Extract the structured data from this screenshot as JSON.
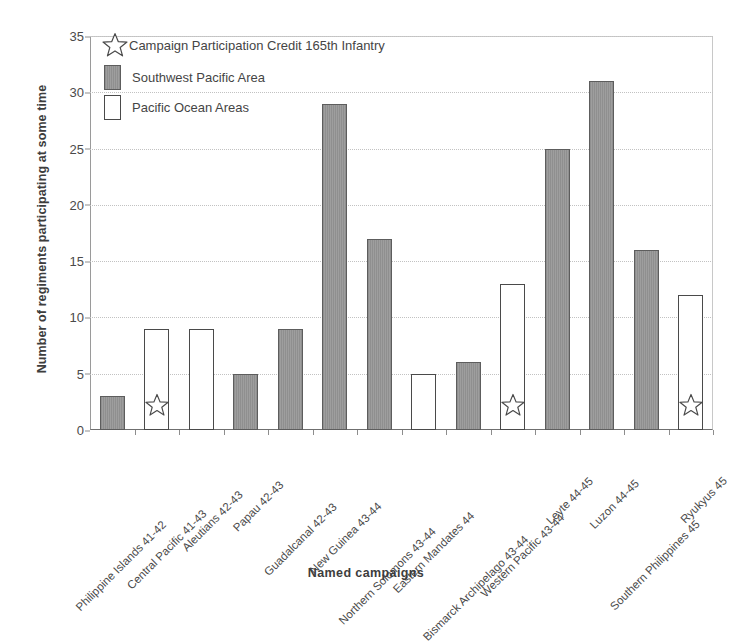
{
  "chart_data": {
    "type": "bar",
    "title": "",
    "xlabel": "Named campaigns",
    "ylabel": "Number of regiments participating at some time",
    "ylim": [
      0,
      35
    ],
    "ytick_step": 5,
    "yticks": [
      0,
      5,
      10,
      15,
      20,
      25,
      30,
      35
    ],
    "grid": true,
    "legend_position": "upper-left-inside",
    "categories": [
      "Philippine Islands 41-42",
      "Central Pacific 41-43",
      "Aleutians 42-43",
      "Papau 42-43",
      "Guadalcanal 42-43",
      "New Guinea 43-44",
      "Northern Solomons 43-44",
      "Eastern Mandates 44",
      "Bismarck Archipelago 43-44",
      "Western Pacific 43-44",
      "Leyte 44-45",
      "Luzon 44-45",
      "Southern Philippines 45",
      "Ryukyus 45"
    ],
    "values": [
      3,
      9,
      9,
      5,
      9,
      29,
      17,
      5,
      6,
      13,
      25,
      31,
      16,
      12
    ],
    "series_of_bar": [
      "Southwest Pacific Area",
      "Pacific Ocean Areas",
      "Pacific Ocean Areas",
      "Southwest Pacific Area",
      "Southwest Pacific Area",
      "Southwest Pacific Area",
      "Southwest Pacific Area",
      "Pacific Ocean Areas",
      "Southwest Pacific Area",
      "Pacific Ocean Areas",
      "Southwest Pacific Area",
      "Southwest Pacific Area",
      "Southwest Pacific Area",
      "Pacific Ocean Areas"
    ],
    "star_marked": [
      false,
      true,
      false,
      false,
      false,
      false,
      false,
      false,
      false,
      true,
      false,
      false,
      false,
      true
    ],
    "series": [
      {
        "name": "Southwest Pacific Area",
        "color": "#949494",
        "values": [
          3,
          null,
          null,
          5,
          9,
          29,
          17,
          null,
          6,
          null,
          25,
          31,
          16,
          null
        ]
      },
      {
        "name": "Pacific Ocean Areas",
        "color": "#ffffff",
        "values": [
          null,
          9,
          9,
          null,
          null,
          null,
          null,
          5,
          null,
          13,
          null,
          null,
          null,
          12
        ]
      }
    ],
    "annotations": [
      {
        "marker": "star",
        "label": "Campaign Participation Credit 165th Infantry",
        "applies_to": [
          "Central Pacific 41-43",
          "Western Pacific 43-44",
          "Ryukyus 45"
        ]
      }
    ]
  },
  "legend": {
    "credit_label": "Campaign Participation Credit 165th Infantry",
    "entries": [
      {
        "label": "Southwest Pacific Area",
        "swatch": "swpa"
      },
      {
        "label": "Pacific Ocean Areas",
        "swatch": "poa"
      }
    ]
  },
  "axes": {
    "y_title": "Number of regiments participating at some time",
    "x_title": "Named campaigns"
  },
  "colors": {
    "bar_southwest_pacific": "#949494",
    "bar_pacific_ocean": "#ffffff",
    "bar_outline": "#5d5d5d",
    "gridline": "#c2c2c2",
    "axis": "#6f6f6f",
    "text": "#454545"
  }
}
